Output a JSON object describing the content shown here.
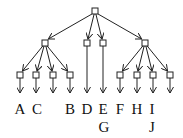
{
  "diagram": {
    "type": "tree",
    "root": {
      "x": 95,
      "y": 11
    },
    "level2": [
      {
        "id": "n1",
        "x": 45,
        "y": 43
      },
      {
        "id": "n2",
        "x": 87,
        "y": 43
      },
      {
        "id": "n3",
        "x": 103,
        "y": 43
      },
      {
        "id": "n4",
        "x": 145,
        "y": 43
      }
    ],
    "level3": [
      {
        "id": "n5",
        "parent": "n1",
        "x": 20,
        "y": 75
      },
      {
        "id": "n6",
        "parent": "n1",
        "x": 36,
        "y": 75
      },
      {
        "id": "n7",
        "parent": "n1",
        "x": 53,
        "y": 75
      },
      {
        "id": "n8",
        "parent": "n1",
        "x": 70,
        "y": 75
      },
      {
        "id": "n9",
        "parent": "n4",
        "x": 120,
        "y": 75
      },
      {
        "id": "n10",
        "parent": "n4",
        "x": 137,
        "y": 75
      },
      {
        "id": "n11",
        "parent": "n4",
        "x": 153,
        "y": 75
      },
      {
        "id": "n12",
        "parent": "n4",
        "x": 170,
        "y": 75
      }
    ],
    "labels": [
      {
        "text": "A",
        "x": 20,
        "y": 114
      },
      {
        "text": "C",
        "x": 37,
        "y": 114
      },
      {
        "text": "B",
        "x": 70,
        "y": 114
      },
      {
        "text": "D",
        "x": 87,
        "y": 114
      },
      {
        "text": "E",
        "x": 103,
        "y": 114
      },
      {
        "text": "F",
        "x": 120,
        "y": 114
      },
      {
        "text": "H",
        "x": 137,
        "y": 114
      },
      {
        "text": "I",
        "x": 152,
        "y": 114
      },
      {
        "text": "G",
        "x": 104,
        "y": 132
      },
      {
        "text": "J",
        "x": 152,
        "y": 132
      }
    ]
  }
}
